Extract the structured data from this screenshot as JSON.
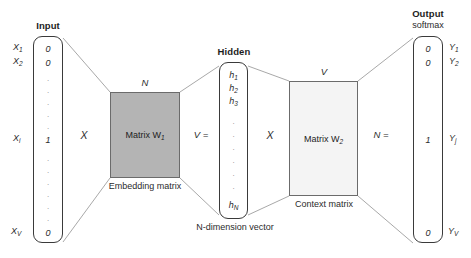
{
  "diagram": {
    "title_hidden": "word2vec neural network architecture",
    "colors": {
      "embedding_fill": "#b4b4b4",
      "context_fill": "#f4f4f4",
      "stroke": "#3a3a3a",
      "line": "#9a9a9a",
      "text": "#2b2b2b"
    }
  },
  "input": {
    "header": "Input",
    "values": [
      "0",
      "0",
      "1",
      "0"
    ],
    "labels": [
      "X₁",
      "X₂",
      "Xᵢ",
      "Xᵥ"
    ],
    "label_parts": [
      {
        "base": "X",
        "sub": "1"
      },
      {
        "base": "X",
        "sub": "2"
      },
      {
        "base": "X",
        "sub": "i"
      },
      {
        "base": "X",
        "sub": "V"
      }
    ]
  },
  "embedding": {
    "name": "Matrix W",
    "subscript": "1",
    "top_dim": "N",
    "caption": "Embedding matrix"
  },
  "hidden": {
    "header": "Hidden",
    "values": [
      "h₁",
      "h₂",
      "h₃",
      "hₙ"
    ],
    "value_parts": [
      {
        "base": "h",
        "sub": "1"
      },
      {
        "base": "h",
        "sub": "2"
      },
      {
        "base": "h",
        "sub": "3"
      },
      {
        "base": "h",
        "sub": "N"
      }
    ],
    "caption": "N-dimension vector",
    "left_dim": "V ="
  },
  "context": {
    "name": "Matrix W",
    "subscript": "2",
    "top_dim": "V",
    "caption": "Context matrix",
    "right_dim": "N ="
  },
  "output": {
    "header": "Output",
    "subheader": "softmax",
    "values": [
      "0",
      "0",
      "1",
      "0"
    ],
    "label_parts": [
      {
        "base": "Y",
        "sub": "1"
      },
      {
        "base": "Y",
        "sub": "2"
      },
      {
        "base": "Y",
        "sub": "j"
      },
      {
        "base": "Y",
        "sub": "V"
      }
    ]
  },
  "operators": {
    "mult1": "X",
    "mult2": "X"
  }
}
